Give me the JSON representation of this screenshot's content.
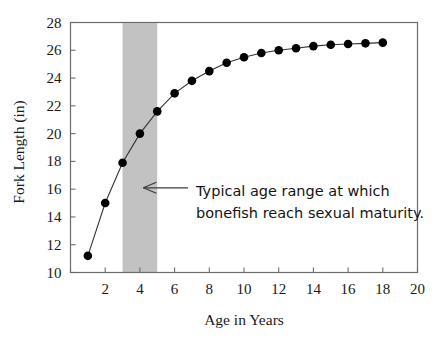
{
  "chart_data": {
    "type": "line",
    "title": "",
    "xlabel": "Age in Years",
    "ylabel": "Fork Length (in)",
    "xlim": [
      0,
      20
    ],
    "ylim": [
      10,
      28
    ],
    "xticks": [
      0,
      2,
      4,
      6,
      8,
      10,
      12,
      14,
      16,
      18,
      20
    ],
    "xtick_labels": [
      "",
      "2",
      "4",
      "6",
      "8",
      "10",
      "12",
      "14",
      "16",
      "18",
      "20"
    ],
    "yticks": [
      10,
      12,
      14,
      16,
      18,
      20,
      22,
      24,
      26,
      28
    ],
    "ytick_labels": [
      "10",
      "12",
      "14",
      "16",
      "18",
      "20",
      "22",
      "24",
      "26",
      "28"
    ],
    "grid": false,
    "legend": false,
    "marker": "filled-circle",
    "x": [
      1,
      2,
      3,
      4,
      5,
      6,
      7,
      8,
      9,
      10,
      11,
      12,
      13,
      14,
      15,
      16,
      17,
      18
    ],
    "values": [
      11.2,
      15.0,
      17.9,
      20.0,
      21.6,
      22.9,
      23.8,
      24.5,
      25.1,
      25.5,
      25.8,
      26.0,
      26.15,
      26.3,
      26.4,
      26.45,
      26.5,
      26.55
    ],
    "series": [
      {
        "name": "Fork Length",
        "values": [
          11.2,
          15.0,
          17.9,
          20.0,
          21.6,
          22.9,
          23.8,
          24.5,
          25.1,
          25.5,
          25.8,
          26.0,
          26.15,
          26.3,
          26.4,
          26.45,
          26.5,
          26.55
        ]
      }
    ],
    "shaded_band": {
      "x_start": 3,
      "x_end": 5,
      "color": "#c2c2c2",
      "label": "Typical age range at which bonefish reach sexual maturity."
    },
    "annotations": [
      {
        "line1": "Typical age range at which",
        "line2": "bonefish reach sexual maturity.",
        "arrow": "left-arrow",
        "arrow_target_x": 4.2,
        "arrow_target_y": 16.1
      }
    ],
    "colors": {
      "line": "#333333",
      "marker": "#000000",
      "band": "#c2c2c2",
      "axis": "#6b6b6b",
      "text": "#1a1a1a",
      "background": "#ffffff"
    }
  },
  "axes": {
    "y_title": "Fork Length (in)",
    "x_title": "Age in Years"
  },
  "annotation": {
    "line1": "Typical age range at which",
    "line2": "bonefish reach sexual maturity."
  }
}
